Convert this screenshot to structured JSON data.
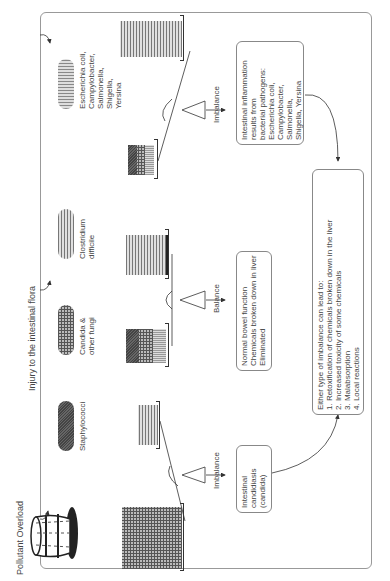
{
  "diagram": {
    "orientation": "rotated 90deg counterclockwise",
    "title_left": "Pollutant Overload",
    "title_top": "Injury to the intestinal flora",
    "flora": [
      {
        "label": "Staphylococci",
        "pattern": "dark"
      },
      {
        "label": "Candida &\nother fungi",
        "pattern": "grid"
      },
      {
        "label": "Clostridium\ndifficile",
        "pattern": "horizontal-stripes"
      },
      {
        "label": "Escherichia coli,\nCampylobacter,\nSalmonella,\nShigella,\nYersina",
        "pattern": "vertical-stripes"
      }
    ],
    "scales": [
      {
        "state": "Imbalance",
        "outcome": "Intestinal\ncandidiasis\n(candida)"
      },
      {
        "state": "Balance",
        "outcome": "Normal bowel function\nChemicals broken down in liver\nEliminated"
      },
      {
        "state": "Imbalance",
        "outcome": "Intestinal inflammation\nresults from\nbacterial pathogens:\nEscherichia coli,\nCampylobacter,\nSalmonella,\nShigella, Yersina"
      }
    ],
    "summary": {
      "heading": "Either type of imbalance can lead to:",
      "items": [
        "1. Retoxification of chemicals broken down in the liver",
        "2. Increased toxicity of some chemicals",
        "3. Malabsorption",
        "4. Local reactions"
      ]
    }
  }
}
